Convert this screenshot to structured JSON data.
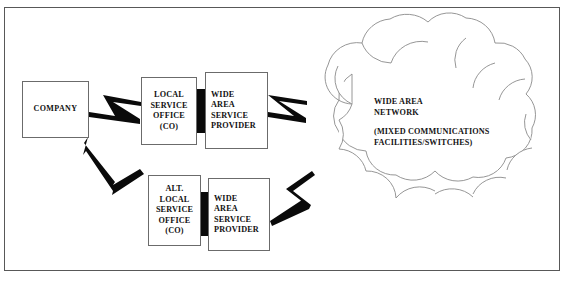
{
  "diagram": {
    "type": "network-topology",
    "nodes": {
      "company": {
        "label": "COMPANY"
      },
      "local_service_office": {
        "label": "LOCAL\nSERVICE\nOFFICE\n(CO)"
      },
      "wide_area_service_provider_top": {
        "label": "WIDE\nAREA\nSERVICE\nPROVIDER"
      },
      "alt_local_service_office": {
        "label": "ALT.\nLOCAL\nSERVICE\nOFFICE\n(CO)"
      },
      "wide_area_service_provider_bottom": {
        "label": "WIDE\nAREA\nSERVICE\nPROVIDER"
      }
    },
    "cloud": {
      "title": "WIDE AREA\n NETWORK",
      "subtitle": "(MIXED COMMUNICATIONS\n FACILITIES/SWITCHES)"
    },
    "connectors": [
      {
        "name": "company-to-local-service-office",
        "style": "lightning-bolt"
      },
      {
        "name": "company-to-alt-local-service-office",
        "style": "lightning-bolt"
      },
      {
        "name": "top-provider-to-network-cloud",
        "style": "lightning-bolt"
      },
      {
        "name": "bottom-provider-to-network-cloud",
        "style": "lightning-bolt"
      }
    ],
    "trunks": [
      {
        "name": "top-trunk-link",
        "style": "solid-black-bar"
      },
      {
        "name": "bottom-trunk-link",
        "style": "solid-black-bar"
      }
    ],
    "colors": {
      "line": "#0a0a0a",
      "cloud_stroke": "#8a8a8a",
      "box_stroke": "#6b6b6b",
      "frame_stroke": "#585858",
      "background": "#ffffff"
    }
  }
}
